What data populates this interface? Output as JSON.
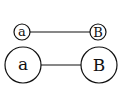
{
  "diagram": {
    "rows": [
      {
        "size": "small",
        "left_node": {
          "label": "a"
        },
        "right_node": {
          "label": "B"
        }
      },
      {
        "size": "large",
        "left_node": {
          "label": "a"
        },
        "right_node": {
          "label": "B"
        }
      }
    ],
    "colors": {
      "stroke": "#111111",
      "background": "#ffffff"
    }
  }
}
